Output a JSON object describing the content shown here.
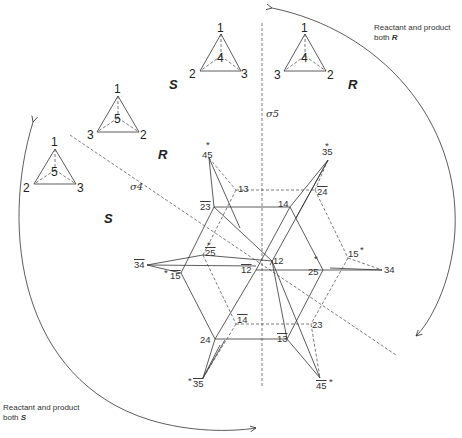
{
  "notes": {
    "top_right": {
      "line1": "Reactant and product",
      "line2_prefix": "both ",
      "line2_symbol": "R"
    },
    "bottom_left": {
      "line1": "Reactant and product",
      "line2_prefix": "both ",
      "line2_symbol": "S"
    }
  },
  "region_labels": {
    "s_top": "S",
    "r_top": "R",
    "r_left": "R",
    "s_left": "S"
  },
  "mirror_planes": {
    "sigma4": "σ4",
    "sigma5": "σ5"
  },
  "tetrahedra": [
    {
      "id": "t1",
      "config": "S",
      "apex": "1",
      "center": "4",
      "left": "2",
      "right": "3"
    },
    {
      "id": "t2",
      "config": "R",
      "apex": "1",
      "center": "4",
      "left": "3",
      "right": "2"
    },
    {
      "id": "t3",
      "config": "R",
      "apex": "1",
      "center": "5",
      "left": "3",
      "right": "2"
    },
    {
      "id": "t4",
      "config": "S",
      "apex": "1",
      "center": "5",
      "left": "2",
      "right": "3"
    }
  ],
  "nodes": [
    {
      "id": "45s",
      "label": "45",
      "bar": false,
      "star": "top"
    },
    {
      "id": "35s",
      "label": "35",
      "bar": false,
      "star": "top"
    },
    {
      "id": "13",
      "label": "13",
      "bar": false
    },
    {
      "id": "24b",
      "label": "24",
      "bar": true
    },
    {
      "id": "23b",
      "label": "23",
      "bar": true
    },
    {
      "id": "14",
      "label": "14",
      "bar": false
    },
    {
      "id": "25bs",
      "label": "25",
      "bar": true,
      "star": "top"
    },
    {
      "id": "34b",
      "label": "34",
      "bar": true
    },
    {
      "id": "15bs",
      "label": "15",
      "bar": true,
      "star": "left"
    },
    {
      "id": "12",
      "label": "12",
      "bar": false
    },
    {
      "id": "12b",
      "label": "12",
      "bar": true
    },
    {
      "id": "25s",
      "label": "25",
      "bar": false,
      "star": "top"
    },
    {
      "id": "15s",
      "label": "15",
      "bar": false,
      "star": "right"
    },
    {
      "id": "34",
      "label": "34",
      "bar": false
    },
    {
      "id": "14b",
      "label": "14",
      "bar": true
    },
    {
      "id": "23",
      "label": "23",
      "bar": false
    },
    {
      "id": "24",
      "label": "24",
      "bar": false
    },
    {
      "id": "13b",
      "label": "13",
      "bar": true
    },
    {
      "id": "35bs",
      "label": "35",
      "bar": true,
      "star": "left"
    },
    {
      "id": "45bs",
      "label": "45",
      "bar": true,
      "star": "right"
    }
  ],
  "labels": {
    "n45s": "45",
    "n35s": "35",
    "n13": "13",
    "n24b": "24",
    "n23b": "23",
    "n14": "14",
    "n25bs": "25",
    "n34b": "34",
    "n15bs": "15",
    "n12": "12",
    "n12b": "12",
    "n25s": "25",
    "n15s": "15",
    "n34": "34",
    "n14b": "14",
    "n23": "23",
    "n24": "24",
    "n13b": "13",
    "n35bs": "35",
    "n45bs": "45",
    "star": "*"
  }
}
